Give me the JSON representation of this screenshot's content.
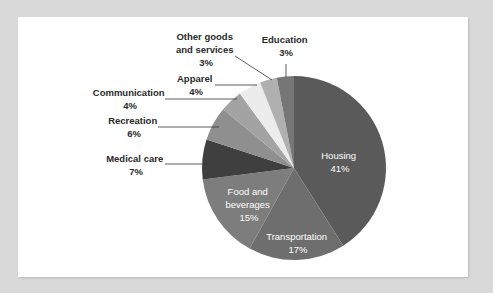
{
  "chart_data": {
    "type": "pie",
    "title": "",
    "start_angle_deg": 0,
    "direction": "clockwise",
    "slices": [
      {
        "label": "Housing",
        "value": 41,
        "pct_label": "41%",
        "color": "#5a5a5a"
      },
      {
        "label": "Transportation",
        "value": 17,
        "pct_label": "17%",
        "color": "#6e6e6e"
      },
      {
        "label": "Food and beverages",
        "value": 15,
        "pct_label": "15%",
        "color": "#7d7d7d"
      },
      {
        "label": "Medical care",
        "value": 7,
        "pct_label": "7%",
        "color": "#3f3f3f"
      },
      {
        "label": "Recreation",
        "value": 6,
        "pct_label": "6%",
        "color": "#8f8f8f"
      },
      {
        "label": "Communication",
        "value": 4,
        "pct_label": "4%",
        "color": "#a3a3a3"
      },
      {
        "label": "Apparel",
        "value": 4,
        "pct_label": "4%",
        "color": "#ececec"
      },
      {
        "label": "Other goods and services",
        "value": 3,
        "pct_label": "3%",
        "color": "#b0b0b0"
      },
      {
        "label": "Education",
        "value": 3,
        "pct_label": "3%",
        "color": "#767676"
      }
    ],
    "legend": "none (callout labels)"
  },
  "labels": {
    "housing": {
      "line1": "Housing",
      "line2": "41%"
    },
    "transportation": {
      "line1": "Transportation",
      "line2": "17%"
    },
    "food": {
      "line1": "Food and",
      "line2": "beverages",
      "line3": "15%"
    },
    "medical": {
      "line1": "Medical care",
      "line2": "7%"
    },
    "recreation": {
      "line1": "Recreation",
      "line2": "6%"
    },
    "communication": {
      "line1": "Communication",
      "line2": "4%"
    },
    "apparel": {
      "line1": "Apparel",
      "line2": "4%"
    },
    "other": {
      "line1": "Other goods",
      "line2": "and services",
      "line3": "3%"
    },
    "education": {
      "line1": "Education",
      "line2": "3%"
    }
  }
}
